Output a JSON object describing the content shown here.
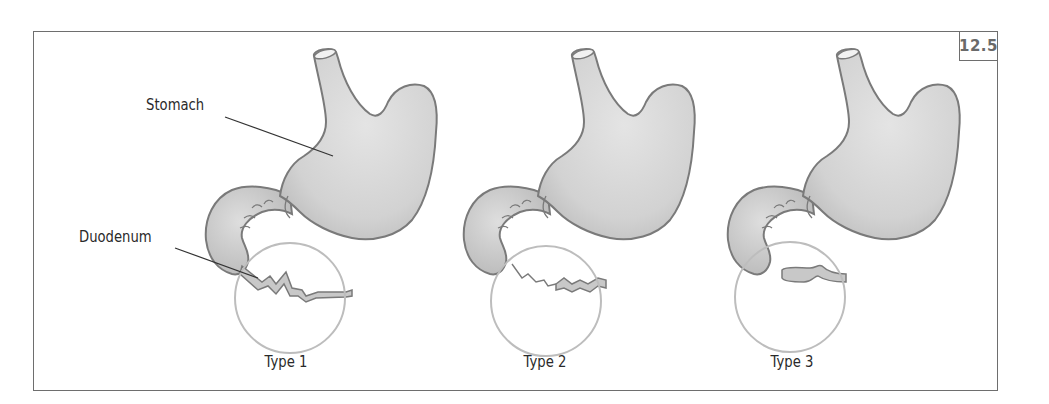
{
  "figure": {
    "number": "12.5",
    "labels": {
      "stomach": "Stomach",
      "duodenum": "Duodenum"
    },
    "panels": [
      {
        "id": "type1",
        "caption": "Type 1"
      },
      {
        "id": "type2",
        "caption": "Type 2"
      },
      {
        "id": "type3",
        "caption": "Type 3"
      }
    ]
  },
  "colors": {
    "organ_fill": "#d4d4d4",
    "organ_outline": "#7a7a7a",
    "circle": "#bdbdbd",
    "frame": "#6e6e6e",
    "text": "#2a2a2a"
  }
}
